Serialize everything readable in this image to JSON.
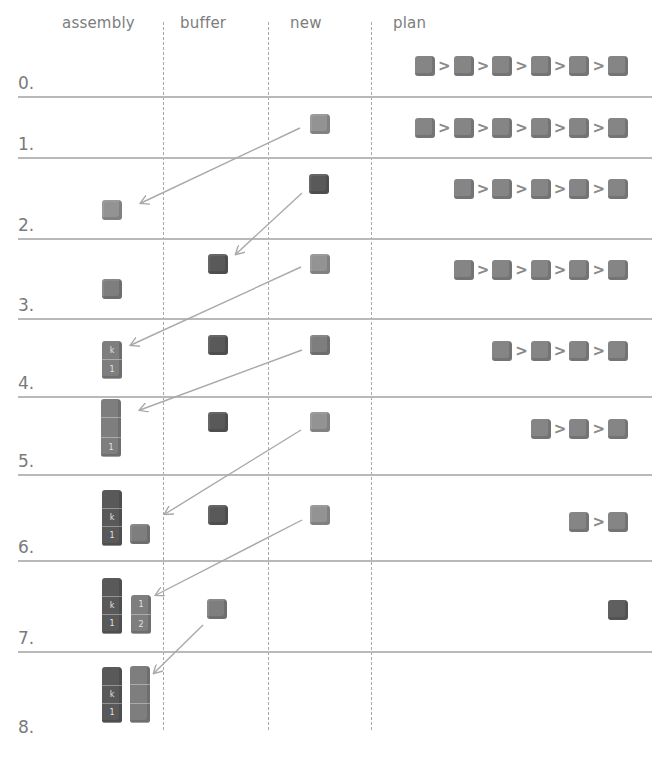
{
  "columns": [
    {
      "id": "assembly",
      "label": "assembly",
      "x": 62
    },
    {
      "id": "buffer",
      "label": "buffer",
      "x": 180
    },
    {
      "id": "new",
      "label": "new",
      "x": 290
    },
    {
      "id": "plan",
      "label": "plan",
      "x": 393
    }
  ],
  "column_dividers_x": [
    163,
    268,
    371
  ],
  "rows": [
    {
      "label": "0.",
      "label_y": 73,
      "separator_y": 96,
      "plan": [
        "c",
        "c",
        "c",
        "c",
        "c",
        "c"
      ],
      "plan_y": 56
    },
    {
      "label": "1.",
      "label_y": 134,
      "separator_y": 157,
      "plan": [
        "c",
        "c",
        "c",
        "c",
        "c",
        "c"
      ],
      "plan_y": 118
    },
    {
      "label": "2.",
      "label_y": 215,
      "separator_y": 238,
      "plan": [
        "c",
        "c",
        "c",
        "c",
        "c"
      ],
      "plan_y": 179
    },
    {
      "label": "3.",
      "label_y": 295,
      "separator_y": 318,
      "plan": [
        "c",
        "c",
        "c",
        "c",
        "c"
      ],
      "plan_y": 260
    },
    {
      "label": "4.",
      "label_y": 373,
      "separator_y": 396,
      "plan": [
        "c",
        "c",
        "c",
        "c"
      ],
      "plan_y": 341
    },
    {
      "label": "5.",
      "label_y": 451,
      "separator_y": 474,
      "plan": [
        "c",
        "c",
        "c"
      ],
      "plan_y": 419
    },
    {
      "label": "6.",
      "label_y": 537,
      "separator_y": 560,
      "plan": [
        "c",
        "c"
      ],
      "plan_y": 512
    },
    {
      "label": "7.",
      "label_y": 628,
      "separator_y": 651,
      "plan": [
        "d"
      ],
      "plan_y": 600
    },
    {
      "label": "8.",
      "label_y": 717,
      "separator_y": null,
      "plan": [],
      "plan_y": 0
    }
  ],
  "plan_separator_glyph": ">",
  "colors": {
    "background": "#ffffff",
    "text": "#7a7a7a",
    "line": "#b9b9b9",
    "arrow": "#a9a9a9",
    "cube_light": "#939393",
    "cube_mid": "#7e7e7e",
    "cube_dark": "#595959"
  },
  "cubes": [
    {
      "row": 1,
      "column": "new",
      "shade": "light",
      "x": 310,
      "y": 114
    },
    {
      "row": 2,
      "column": "new",
      "shade": "dark",
      "x": 309,
      "y": 174
    },
    {
      "row": 2,
      "column": "assembly",
      "shade": "light",
      "x": 102,
      "y": 200
    },
    {
      "row": 3,
      "column": "buffer",
      "shade": "dark",
      "x": 208,
      "y": 254
    },
    {
      "row": 3,
      "column": "new",
      "shade": "light",
      "x": 310,
      "y": 254
    },
    {
      "row": 3,
      "column": "assembly",
      "shade": "mid",
      "x": 102,
      "y": 279
    },
    {
      "row": 4,
      "column": "buffer",
      "shade": "dark",
      "x": 208,
      "y": 335
    },
    {
      "row": 4,
      "column": "new",
      "shade": "mid",
      "x": 310,
      "y": 335
    },
    {
      "row": 5,
      "column": "buffer",
      "shade": "dark",
      "x": 208,
      "y": 412
    },
    {
      "row": 5,
      "column": "new",
      "shade": "light",
      "x": 310,
      "y": 412
    },
    {
      "row": 6,
      "column": "buffer",
      "shade": "dark",
      "x": 208,
      "y": 505
    },
    {
      "row": 6,
      "column": "new",
      "shade": "light",
      "x": 310,
      "y": 505
    },
    {
      "row": 6,
      "column": "assembly",
      "shade": "mid",
      "x": 130,
      "y": 524
    },
    {
      "row": 7,
      "column": "buffer",
      "shade": "mid",
      "x": 207,
      "y": 599
    }
  ],
  "towers": [
    {
      "row": 4,
      "x": 102,
      "y": 341,
      "height": 38,
      "shade": "mid",
      "segments": [
        "k",
        "1"
      ]
    },
    {
      "row": 5,
      "x": 101,
      "y": 399,
      "height": 58,
      "shade": "mid",
      "segments": [
        "",
        "",
        "1"
      ]
    },
    {
      "row": 6,
      "x": 102,
      "y": 490,
      "height": 56,
      "shade": "dark",
      "segments": [
        "",
        "k",
        "1"
      ]
    },
    {
      "row": 7,
      "x": 102,
      "y": 578,
      "height": 56,
      "shade": "dark",
      "segments": [
        "",
        "k",
        "1"
      ]
    },
    {
      "row": 7,
      "x": 131,
      "y": 595,
      "height": 39,
      "shade": "mid",
      "segments": [
        "1",
        "2"
      ]
    },
    {
      "row": 8,
      "x": 102,
      "y": 667,
      "height": 56,
      "shade": "dark",
      "segments": [
        "",
        "k",
        "1"
      ]
    },
    {
      "row": 8,
      "x": 130,
      "y": 666,
      "height": 57,
      "shade": "mid",
      "segments": [
        "",
        "",
        ""
      ]
    }
  ],
  "arrows": [
    {
      "from": [
        300,
        128
      ],
      "to": [
        141,
        203
      ],
      "label": "new-to-assembly row1-2"
    },
    {
      "from": [
        302,
        193
      ],
      "to": [
        236,
        254
      ],
      "label": "new-to-buffer row2-3"
    },
    {
      "from": [
        301,
        267
      ],
      "to": [
        131,
        345
      ],
      "label": "new-to-assembly row3-4"
    },
    {
      "from": [
        302,
        350
      ],
      "to": [
        140,
        410
      ],
      "label": "new-to-assembly row4-5"
    },
    {
      "from": [
        301,
        430
      ],
      "to": [
        165,
        514
      ],
      "label": "new-to-assembly row5-6"
    },
    {
      "from": [
        302,
        520
      ],
      "to": [
        156,
        595
      ],
      "label": "new-to-assembly row6-7"
    },
    {
      "from": [
        203,
        625
      ],
      "to": [
        154,
        673
      ],
      "label": "buffer-to-assembly row7-8"
    }
  ]
}
